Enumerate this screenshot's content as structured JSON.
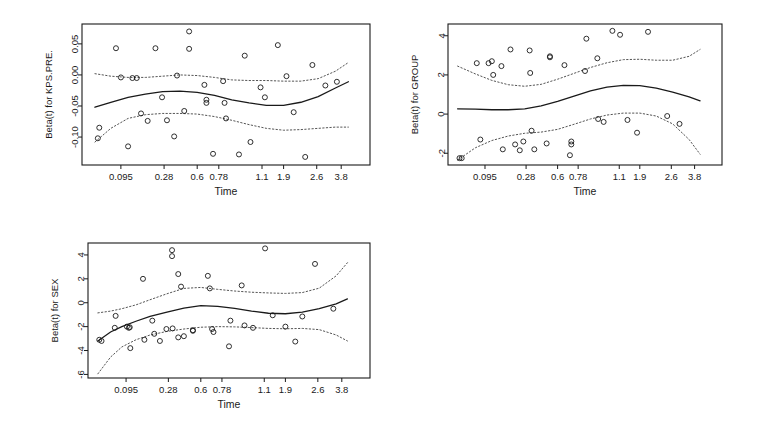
{
  "figure": {
    "background": "#ffffff",
    "line_color": "#1a1a1a",
    "band_color": "#555555",
    "point_color": "#1a1a1a"
  },
  "chart_data": [
    {
      "type": "scatter",
      "id": "kps-pre",
      "title": "",
      "xlabel": "Time",
      "ylabel": "Beta(t) for KPS.PRE.",
      "x_tick_labels": [
        "0.095",
        "0.28",
        "0.6",
        "0.78",
        "1.1",
        "1.9",
        "2.6",
        "3.8"
      ],
      "x_tick_pos": [
        0.135,
        0.285,
        0.4,
        0.475,
        0.625,
        0.7,
        0.815,
        0.9
      ],
      "y_tick_labels": [
        "0.05",
        "0.00",
        "-0.05",
        "-0.10"
      ],
      "y_ticks": [
        0.05,
        0.0,
        -0.05,
        -0.1
      ],
      "ylim": [
        -0.145,
        0.082
      ],
      "xlim": [
        0,
        1
      ],
      "grid": false,
      "legend": "none",
      "points": [
        [
          0.06,
          -0.085
        ],
        [
          0.055,
          -0.102
        ],
        [
          0.118,
          0.043
        ],
        [
          0.135,
          -0.004
        ],
        [
          0.175,
          -0.005
        ],
        [
          0.19,
          -0.005
        ],
        [
          0.16,
          -0.115
        ],
        [
          0.205,
          -0.062
        ],
        [
          0.228,
          -0.074
        ],
        [
          0.255,
          0.043
        ],
        [
          0.278,
          -0.036
        ],
        [
          0.295,
          -0.073
        ],
        [
          0.33,
          -0.001
        ],
        [
          0.32,
          -0.099
        ],
        [
          0.355,
          -0.058
        ],
        [
          0.372,
          0.07
        ],
        [
          0.372,
          0.042
        ],
        [
          0.425,
          -0.016
        ],
        [
          0.432,
          -0.04
        ],
        [
          0.432,
          -0.045
        ],
        [
          0.455,
          -0.127
        ],
        [
          0.49,
          -0.01
        ],
        [
          0.495,
          -0.045
        ],
        [
          0.5,
          -0.07
        ],
        [
          0.545,
          -0.128
        ],
        [
          0.565,
          0.031
        ],
        [
          0.585,
          -0.108
        ],
        [
          0.62,
          -0.02
        ],
        [
          0.635,
          -0.036
        ],
        [
          0.68,
          0.048
        ],
        [
          0.71,
          -0.002
        ],
        [
          0.735,
          -0.06
        ],
        [
          0.775,
          -0.132
        ],
        [
          0.8,
          0.016
        ],
        [
          0.845,
          -0.017
        ],
        [
          0.885,
          -0.011
        ]
      ],
      "fit_curve": [
        [
          0.045,
          -0.052
        ],
        [
          0.1,
          -0.044
        ],
        [
          0.16,
          -0.036
        ],
        [
          0.22,
          -0.031
        ],
        [
          0.28,
          -0.027
        ],
        [
          0.34,
          -0.026
        ],
        [
          0.4,
          -0.028
        ],
        [
          0.46,
          -0.033
        ],
        [
          0.52,
          -0.04
        ],
        [
          0.58,
          -0.045
        ],
        [
          0.64,
          -0.049
        ],
        [
          0.7,
          -0.049
        ],
        [
          0.76,
          -0.044
        ],
        [
          0.82,
          -0.035
        ],
        [
          0.88,
          -0.021
        ],
        [
          0.925,
          -0.011
        ]
      ],
      "upper_band": [
        [
          0.045,
          0.002
        ],
        [
          0.1,
          -0.002
        ],
        [
          0.16,
          -0.004
        ],
        [
          0.22,
          -0.004
        ],
        [
          0.28,
          -0.002
        ],
        [
          0.34,
          0.0
        ],
        [
          0.4,
          -0.001
        ],
        [
          0.46,
          -0.004
        ],
        [
          0.52,
          -0.008
        ],
        [
          0.58,
          -0.009
        ],
        [
          0.64,
          -0.009
        ],
        [
          0.7,
          -0.01
        ],
        [
          0.76,
          -0.01
        ],
        [
          0.82,
          -0.006
        ],
        [
          0.88,
          0.006
        ],
        [
          0.925,
          0.02
        ]
      ],
      "lower_band": [
        [
          0.045,
          -0.108
        ],
        [
          0.1,
          -0.086
        ],
        [
          0.16,
          -0.07
        ],
        [
          0.22,
          -0.064
        ],
        [
          0.28,
          -0.062
        ],
        [
          0.34,
          -0.062
        ],
        [
          0.4,
          -0.063
        ],
        [
          0.46,
          -0.067
        ],
        [
          0.52,
          -0.073
        ],
        [
          0.58,
          -0.08
        ],
        [
          0.64,
          -0.086
        ],
        [
          0.7,
          -0.089
        ],
        [
          0.76,
          -0.088
        ],
        [
          0.82,
          -0.086
        ],
        [
          0.88,
          -0.084
        ],
        [
          0.925,
          -0.084
        ]
      ]
    },
    {
      "type": "scatter",
      "id": "group",
      "title": "",
      "xlabel": "Time",
      "ylabel": "Beta(t) for GROUP",
      "x_tick_labels": [
        "0.095",
        "0.28",
        "0.6",
        "0.78",
        "1.1",
        "1.9",
        "2.6",
        "3.8"
      ],
      "x_tick_pos": [
        0.135,
        0.285,
        0.4,
        0.475,
        0.625,
        0.7,
        0.815,
        0.9
      ],
      "y_tick_labels": [
        "4",
        "2",
        "0",
        "-2"
      ],
      "y_ticks": [
        4,
        2,
        0,
        -2
      ],
      "ylim": [
        -2.6,
        4.6
      ],
      "xlim": [
        0,
        1
      ],
      "grid": false,
      "legend": "none",
      "points": [
        [
          0.042,
          -2.25
        ],
        [
          0.05,
          -2.25
        ],
        [
          0.105,
          2.6
        ],
        [
          0.118,
          -1.3
        ],
        [
          0.148,
          2.6
        ],
        [
          0.16,
          2.7
        ],
        [
          0.165,
          2.0
        ],
        [
          0.195,
          2.45
        ],
        [
          0.2,
          -1.8
        ],
        [
          0.228,
          3.3
        ],
        [
          0.245,
          -1.55
        ],
        [
          0.262,
          -1.85
        ],
        [
          0.275,
          -1.4
        ],
        [
          0.298,
          3.25
        ],
        [
          0.3,
          2.1
        ],
        [
          0.305,
          -0.85
        ],
        [
          0.315,
          -1.8
        ],
        [
          0.372,
          2.9
        ],
        [
          0.372,
          2.95
        ],
        [
          0.36,
          -1.5
        ],
        [
          0.425,
          2.5
        ],
        [
          0.445,
          -2.1
        ],
        [
          0.45,
          -1.4
        ],
        [
          0.45,
          -1.55
        ],
        [
          0.5,
          2.2
        ],
        [
          0.505,
          3.85
        ],
        [
          0.545,
          2.85
        ],
        [
          0.548,
          -0.25
        ],
        [
          0.568,
          -0.4
        ],
        [
          0.6,
          4.25
        ],
        [
          0.628,
          4.05
        ],
        [
          0.655,
          -0.3
        ],
        [
          0.69,
          -0.95
        ],
        [
          0.73,
          4.2
        ],
        [
          0.8,
          -0.1
        ],
        [
          0.845,
          -0.5
        ]
      ],
      "fit_curve": [
        [
          0.035,
          0.27
        ],
        [
          0.1,
          0.25
        ],
        [
          0.16,
          0.22
        ],
        [
          0.22,
          0.22
        ],
        [
          0.28,
          0.27
        ],
        [
          0.34,
          0.42
        ],
        [
          0.4,
          0.65
        ],
        [
          0.46,
          0.92
        ],
        [
          0.52,
          1.18
        ],
        [
          0.58,
          1.38
        ],
        [
          0.64,
          1.47
        ],
        [
          0.7,
          1.45
        ],
        [
          0.76,
          1.32
        ],
        [
          0.82,
          1.12
        ],
        [
          0.88,
          0.88
        ],
        [
          0.92,
          0.68
        ]
      ],
      "upper_band": [
        [
          0.035,
          2.45
        ],
        [
          0.1,
          2.05
        ],
        [
          0.16,
          1.72
        ],
        [
          0.22,
          1.5
        ],
        [
          0.28,
          1.42
        ],
        [
          0.34,
          1.52
        ],
        [
          0.4,
          1.78
        ],
        [
          0.46,
          2.08
        ],
        [
          0.52,
          2.38
        ],
        [
          0.58,
          2.62
        ],
        [
          0.64,
          2.78
        ],
        [
          0.7,
          2.8
        ],
        [
          0.76,
          2.75
        ],
        [
          0.82,
          2.75
        ],
        [
          0.88,
          2.95
        ],
        [
          0.92,
          3.3
        ]
      ],
      "lower_band": [
        [
          0.035,
          -2.35
        ],
        [
          0.1,
          -1.72
        ],
        [
          0.16,
          -1.35
        ],
        [
          0.22,
          -1.12
        ],
        [
          0.28,
          -0.98
        ],
        [
          0.34,
          -0.92
        ],
        [
          0.4,
          -0.78
        ],
        [
          0.46,
          -0.52
        ],
        [
          0.52,
          -0.25
        ],
        [
          0.58,
          -0.05
        ],
        [
          0.64,
          0.05
        ],
        [
          0.7,
          0.05
        ],
        [
          0.76,
          -0.1
        ],
        [
          0.82,
          -0.5
        ],
        [
          0.88,
          -1.3
        ],
        [
          0.92,
          -2.05
        ]
      ]
    },
    {
      "type": "scatter",
      "id": "sex",
      "title": "",
      "xlabel": "Time",
      "ylabel": "Beta(t) for SEX",
      "x_tick_labels": [
        "0.095",
        "0.28",
        "0.6",
        "0.78",
        "1.1",
        "1.9",
        "2.6",
        "3.8"
      ],
      "x_tick_pos": [
        0.135,
        0.285,
        0.4,
        0.475,
        0.625,
        0.7,
        0.815,
        0.9
      ],
      "y_tick_labels": [
        "4",
        "2",
        "0",
        "-2",
        "-4",
        "-6"
      ],
      "y_ticks": [
        4,
        2,
        0,
        -2,
        -4,
        -6
      ],
      "ylim": [
        -6.3,
        5.0
      ],
      "xlim": [
        0,
        1
      ],
      "grid": false,
      "legend": "none",
      "points": [
        [
          0.04,
          -3.1
        ],
        [
          0.048,
          -3.2
        ],
        [
          0.098,
          -1.1
        ],
        [
          0.095,
          -2.1
        ],
        [
          0.138,
          -2.0
        ],
        [
          0.145,
          -2.1
        ],
        [
          0.148,
          -2.05
        ],
        [
          0.15,
          -3.8
        ],
        [
          0.195,
          2.0
        ],
        [
          0.2,
          -3.1
        ],
        [
          0.228,
          -1.5
        ],
        [
          0.235,
          -2.6
        ],
        [
          0.255,
          -3.2
        ],
        [
          0.278,
          -2.2
        ],
        [
          0.298,
          4.4
        ],
        [
          0.298,
          3.9
        ],
        [
          0.3,
          -2.15
        ],
        [
          0.32,
          2.4
        ],
        [
          0.32,
          -2.9
        ],
        [
          0.33,
          1.35
        ],
        [
          0.34,
          -2.8
        ],
        [
          0.372,
          -2.35
        ],
        [
          0.372,
          -2.3
        ],
        [
          0.425,
          2.25
        ],
        [
          0.432,
          1.2
        ],
        [
          0.44,
          -2.2
        ],
        [
          0.445,
          -2.45
        ],
        [
          0.5,
          -3.65
        ],
        [
          0.505,
          -1.5
        ],
        [
          0.545,
          1.45
        ],
        [
          0.555,
          -1.9
        ],
        [
          0.585,
          -2.1
        ],
        [
          0.628,
          4.55
        ],
        [
          0.655,
          -1.05
        ],
        [
          0.7,
          -2.0
        ],
        [
          0.735,
          -3.25
        ],
        [
          0.76,
          -1.15
        ],
        [
          0.805,
          3.25
        ],
        [
          0.87,
          -0.5
        ]
      ],
      "fit_curve": [
        [
          0.035,
          -3.2
        ],
        [
          0.08,
          -2.45
        ],
        [
          0.12,
          -2.0
        ],
        [
          0.17,
          -1.55
        ],
        [
          0.22,
          -1.15
        ],
        [
          0.28,
          -0.78
        ],
        [
          0.34,
          -0.45
        ],
        [
          0.4,
          -0.25
        ],
        [
          0.46,
          -0.3
        ],
        [
          0.52,
          -0.48
        ],
        [
          0.58,
          -0.7
        ],
        [
          0.64,
          -0.88
        ],
        [
          0.7,
          -0.92
        ],
        [
          0.76,
          -0.78
        ],
        [
          0.82,
          -0.5
        ],
        [
          0.88,
          -0.1
        ],
        [
          0.92,
          0.32
        ]
      ],
      "upper_band": [
        [
          0.035,
          -0.85
        ],
        [
          0.08,
          -0.7
        ],
        [
          0.12,
          -0.5
        ],
        [
          0.17,
          -0.18
        ],
        [
          0.22,
          0.25
        ],
        [
          0.28,
          0.75
        ],
        [
          0.34,
          1.2
        ],
        [
          0.4,
          1.28
        ],
        [
          0.46,
          1.12
        ],
        [
          0.52,
          0.98
        ],
        [
          0.58,
          0.88
        ],
        [
          0.64,
          0.82
        ],
        [
          0.7,
          0.78
        ],
        [
          0.76,
          0.85
        ],
        [
          0.82,
          1.22
        ],
        [
          0.88,
          2.25
        ],
        [
          0.92,
          3.35
        ]
      ],
      "lower_band": [
        [
          0.035,
          -5.95
        ],
        [
          0.08,
          -4.55
        ],
        [
          0.12,
          -3.7
        ],
        [
          0.17,
          -3.1
        ],
        [
          0.22,
          -2.7
        ],
        [
          0.28,
          -2.4
        ],
        [
          0.34,
          -2.2
        ],
        [
          0.4,
          -2.05
        ],
        [
          0.46,
          -2.0
        ],
        [
          0.52,
          -2.02
        ],
        [
          0.58,
          -2.08
        ],
        [
          0.64,
          -2.15
        ],
        [
          0.7,
          -2.18
        ],
        [
          0.76,
          -2.15
        ],
        [
          0.82,
          -2.25
        ],
        [
          0.88,
          -2.7
        ],
        [
          0.92,
          -3.2
        ]
      ]
    }
  ]
}
